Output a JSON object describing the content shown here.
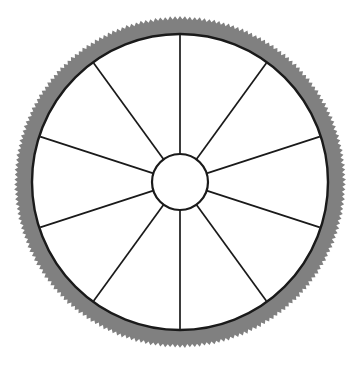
{
  "canvas": {
    "width": 359,
    "height": 365,
    "background_color": "#ffffff"
  },
  "figure": {
    "name": "wagon-wheel"
  },
  "geometry": {
    "center_x": 180,
    "center_y": 182,
    "outer_radius": 166,
    "rim_inner_radius": 148,
    "rim_band_width": 18,
    "hub_radius": 28,
    "hub_stroke_width": 2.2,
    "spoke_count": 10,
    "spoke_angle_step_deg": 36,
    "spoke_start_angle_deg": -90,
    "spoke_stroke_width": 1.7,
    "rim_inner_stroke_width": 2.4,
    "serration_teeth": 210,
    "serration_depth": 3.2
  },
  "colors": {
    "background": "#ffffff",
    "rim_fill": "#808080",
    "rim_line": "#1a1a1a",
    "spoke_line": "#1a1a1a",
    "hub_line": "#1a1a1a",
    "hub_fill": "#ffffff",
    "field_fill": "#ffffff"
  },
  "parts": [
    {
      "id": "outer-rim",
      "label": "Outer rim band",
      "fill": "#808080",
      "edge": "serrated"
    },
    {
      "id": "rim-inner-circle",
      "label": "Rim inner circle",
      "fill": "none",
      "edge": "smooth"
    },
    {
      "id": "spokes",
      "label": "Spokes",
      "count": 10
    },
    {
      "id": "hub",
      "label": "Hub",
      "fill": "#ffffff"
    }
  ]
}
